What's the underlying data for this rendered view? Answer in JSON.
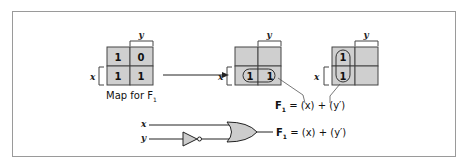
{
  "colors": {
    "cell_fill": "#cfcfcf",
    "grid_line": "#444444",
    "frame": "#9a9a9a",
    "gate_fill": "#cccccc"
  },
  "map1": {
    "caption": "Map for F",
    "caption_sub": "1",
    "col_var": "y",
    "row_var": "x",
    "cells": [
      "1",
      "0",
      "1",
      "1"
    ]
  },
  "map2": {
    "col_var": "y",
    "row_var": "x",
    "cells": [
      "",
      "",
      "1",
      "1"
    ],
    "loop": "row-2"
  },
  "map3": {
    "col_var": "y",
    "row_var": "x",
    "cells": [
      "1",
      "",
      "1",
      ""
    ],
    "loop": "column-1"
  },
  "equation_maps": {
    "lhs": "F",
    "lhs_sub": "1",
    "rhs": " = (x) + (y′)"
  },
  "circuit": {
    "input_x": "x",
    "input_y": "y",
    "gates": [
      "NOT",
      "OR"
    ],
    "output_lhs": "F",
    "output_sub": "1",
    "output_rhs": " = (x) + (y′)"
  }
}
